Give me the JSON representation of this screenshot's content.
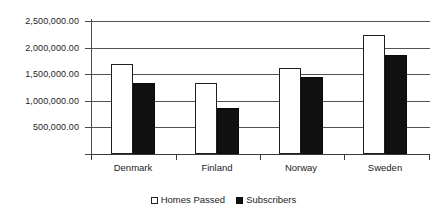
{
  "chart_data": {
    "type": "bar",
    "title": "",
    "subtitle": "",
    "xlabel": "",
    "ylabel": "",
    "categories": [
      "Denmark",
      "Finland",
      "Norway",
      "Sweden"
    ],
    "series": [
      {
        "name": "Homes Passed",
        "marker": "open-square",
        "color": "#ffffff",
        "values": [
          1700000,
          1330000,
          1620000,
          2240000
        ]
      },
      {
        "name": "Subscribers",
        "marker": "filled-square",
        "color": "#111111",
        "values": [
          1330000,
          870000,
          1440000,
          1870000
        ]
      }
    ],
    "ylim": [
      0,
      2500000
    ],
    "ytick_values": [
      500000,
      1000000,
      1500000,
      2000000,
      2500000
    ],
    "ytick_labels": [
      "500,000.00",
      "1,000,000.00",
      "1,500,000.00",
      "2,000,000.00",
      "2,500,000.00"
    ],
    "grid": true,
    "grid_axis": "y",
    "legend": true,
    "legend_position": "bottom-center",
    "legend_entries": [
      "Homes Passed",
      "Subscribers"
    ]
  },
  "axes": {
    "y_axis_name": "value-axis",
    "x_axis_name": "category-axis"
  },
  "colors": {
    "series_homes_passed": "#ffffff",
    "series_subscribers": "#111111",
    "gridline": "#545454",
    "axis": "#3a3a3a",
    "text": "#232323",
    "background": "#ffffff"
  }
}
